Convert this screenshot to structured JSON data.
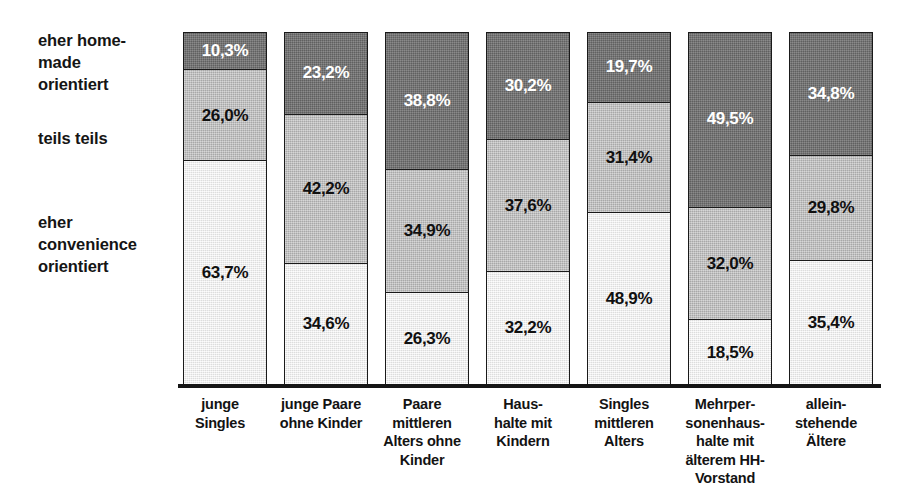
{
  "legend": {
    "items": [
      {
        "key": "homemade",
        "label": "eher home-\nmade\norientiert",
        "color": "#6f6f6f"
      },
      {
        "key": "teils",
        "label": "teils teils",
        "color": "#bdbdbd"
      },
      {
        "key": "convenience",
        "label": "eher\nconvenience\norientiert",
        "color": "#f1f1f1"
      }
    ]
  },
  "axis": {
    "line_color": "#151515"
  },
  "chart_data": {
    "type": "bar",
    "title": "",
    "subtitle": "",
    "xlabel": "",
    "ylabel": "",
    "ylim": [
      0,
      100
    ],
    "grid": false,
    "stacked": true,
    "stack_order": "top-to-bottom",
    "legend_position": "left",
    "value_suffix": "%",
    "decimal_separator": ",",
    "categories": [
      "junge\nSingles",
      "junge Paare\nohne Kinder",
      "Paare\nmittleren\nAlters ohne\nKinder",
      "Haus-\nhalte mit\nKindern",
      "Singles\nmittleren\nAlters",
      "Mehrper-\nsonenhaus-\nhalte mit\nälterem HH-\nVorstand",
      "allein-\nstehende\nÄltere"
    ],
    "series": [
      {
        "name": "eher home-made orientiert",
        "color": "#6f6f6f",
        "label_color": "#ffffff",
        "values": [
          10.3,
          23.2,
          38.8,
          30.2,
          19.7,
          49.5,
          34.8
        ],
        "labels": [
          "10,3%",
          "23,2%",
          "38,8%",
          "30,2%",
          "19,7%",
          "49,5%",
          "34,8%"
        ]
      },
      {
        "name": "teils teils",
        "color": "#bdbdbd",
        "label_color": "#101010",
        "values": [
          26.0,
          42.2,
          34.9,
          37.6,
          31.4,
          32.0,
          29.8
        ],
        "labels": [
          "26,0%",
          "42,2%",
          "34,9%",
          "37,6%",
          "31,4%",
          "32,0%",
          "29,8%"
        ]
      },
      {
        "name": "eher convenience orientiert",
        "color": "#f1f1f1",
        "label_color": "#101010",
        "values": [
          63.7,
          34.6,
          26.3,
          32.2,
          48.9,
          18.5,
          35.4
        ],
        "labels": [
          "63,7%",
          "34,6%",
          "26,3%",
          "32,2%",
          "48,9%",
          "18,5%",
          "35,4%"
        ]
      }
    ]
  }
}
